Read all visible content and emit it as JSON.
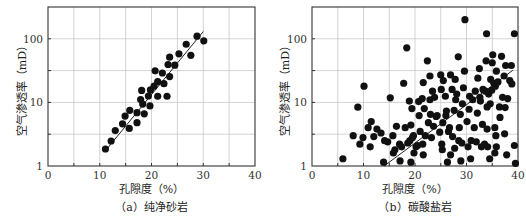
{
  "chart_data": [
    {
      "type": "scatter",
      "panel": "a",
      "title": "",
      "caption": "（a）纯净砂岩",
      "xlabel": "孔隙度（%）",
      "ylabel": "空气渗透率（mD）",
      "xlim": [
        0,
        40
      ],
      "ylim": [
        1,
        316
      ],
      "yscale": "log",
      "xticks": [
        0,
        10,
        20,
        30,
        40
      ],
      "yticks": [
        1,
        10,
        100
      ],
      "grid": true,
      "trendline": {
        "x": [
          11,
          30
        ],
        "y": [
          1.7,
          130
        ]
      },
      "points": [
        [
          11.1,
          1.85
        ],
        [
          12.2,
          2.47
        ],
        [
          13.0,
          3.6
        ],
        [
          14.4,
          4.6
        ],
        [
          14.9,
          6.1
        ],
        [
          15.8,
          7.5
        ],
        [
          15.7,
          3.9
        ],
        [
          17.2,
          4.8
        ],
        [
          17.2,
          6.9
        ],
        [
          17.9,
          11.1
        ],
        [
          18.1,
          15.4
        ],
        [
          18.6,
          6.6
        ],
        [
          18.3,
          9.4
        ],
        [
          19.7,
          8.8
        ],
        [
          19.4,
          12.6
        ],
        [
          19.8,
          15.7
        ],
        [
          20.5,
          18
        ],
        [
          20.7,
          31.3
        ],
        [
          21.2,
          12.5
        ],
        [
          21.2,
          21.2
        ],
        [
          22.1,
          29
        ],
        [
          22.4,
          19.7
        ],
        [
          23.0,
          12.5
        ],
        [
          23.2,
          39.4
        ],
        [
          23.5,
          51.4
        ],
        [
          23.5,
          25.5
        ],
        [
          24.5,
          38.5
        ],
        [
          25.3,
          58
        ],
        [
          26.7,
          82
        ],
        [
          27.6,
          55
        ],
        [
          28.8,
          110
        ],
        [
          30.1,
          93
        ]
      ]
    },
    {
      "type": "scatter",
      "panel": "b",
      "title": "",
      "caption": "（b）碳酸盐岩",
      "xlabel": "孔隙度（%）",
      "ylabel": "空气渗透率（mD）",
      "xlim": [
        0,
        40
      ],
      "ylim": [
        1,
        316
      ],
      "yscale": "log",
      "xticks": [
        0,
        10,
        20,
        30,
        40
      ],
      "yticks": [
        1,
        10,
        100
      ],
      "grid": true,
      "trendline": {
        "x": [
          14,
          39
        ],
        "y": [
          1.0,
          32
        ]
      },
      "points": [
        [
          6.0,
          1.3
        ],
        [
          8.0,
          3.0
        ],
        [
          8.9,
          8.4
        ],
        [
          9.3,
          2.2
        ],
        [
          10.1,
          18
        ],
        [
          9.9,
          2.8
        ],
        [
          10.9,
          4.0
        ],
        [
          11.5,
          5.0
        ],
        [
          11.3,
          2.0
        ],
        [
          12.0,
          2.9
        ],
        [
          12.6,
          3.8
        ],
        [
          13.4,
          3.3
        ],
        [
          13.9,
          1.15
        ],
        [
          14.1,
          2.5
        ],
        [
          14.7,
          2.4
        ],
        [
          15.2,
          11.8
        ],
        [
          15.7,
          3.0
        ],
        [
          15.8,
          1.6
        ],
        [
          16.1,
          1.8
        ],
        [
          16.4,
          4.2
        ],
        [
          17.0,
          2.2
        ],
        [
          17.1,
          1.2
        ],
        [
          17.4,
          2.0
        ],
        [
          17.8,
          20
        ],
        [
          18.1,
          4.0
        ],
        [
          18.4,
          72
        ],
        [
          18.6,
          2.3
        ],
        [
          18.9,
          10.5
        ],
        [
          19.0,
          2.5
        ],
        [
          19.2,
          4.4
        ],
        [
          19.2,
          1.15
        ],
        [
          19.4,
          8.0
        ],
        [
          19.5,
          2.8
        ],
        [
          19.7,
          3.0
        ],
        [
          19.8,
          1.6
        ],
        [
          20.2,
          2.0
        ],
        [
          20.5,
          2.1
        ],
        [
          20.7,
          10.3
        ],
        [
          20.8,
          6.2
        ],
        [
          21.0,
          3.5
        ],
        [
          21.4,
          11.5
        ],
        [
          21.5,
          2.2
        ],
        [
          21.6,
          1.5
        ],
        [
          21.6,
          20.5
        ],
        [
          21.8,
          8.0
        ],
        [
          22.0,
          3.0
        ],
        [
          22.4,
          45
        ],
        [
          22.6,
          4.8
        ],
        [
          22.9,
          11.0
        ],
        [
          22.9,
          26
        ],
        [
          23.0,
          6.5
        ],
        [
          23.2,
          2.8
        ],
        [
          23.4,
          15
        ],
        [
          23.6,
          4.2
        ],
        [
          23.8,
          12.0
        ],
        [
          24.1,
          6.0
        ],
        [
          24.3,
          6.2
        ],
        [
          24.8,
          3.4
        ],
        [
          25.0,
          27
        ],
        [
          25.1,
          16
        ],
        [
          25.2,
          2.2
        ],
        [
          25.3,
          1.8
        ],
        [
          25.4,
          4.8
        ],
        [
          25.5,
          22
        ],
        [
          25.9,
          12.5
        ],
        [
          26.0,
          6.2
        ],
        [
          26.1,
          7.3
        ],
        [
          26.3,
          1.15
        ],
        [
          26.5,
          3.5
        ],
        [
          26.7,
          4.0
        ],
        [
          26.9,
          27
        ],
        [
          26.9,
          1.5
        ],
        [
          27.2,
          16
        ],
        [
          27.3,
          2.9
        ],
        [
          27.6,
          7.5
        ],
        [
          27.7,
          1.9
        ],
        [
          27.8,
          23
        ],
        [
          27.9,
          11
        ],
        [
          28.1,
          13.5
        ],
        [
          28.4,
          52
        ],
        [
          28.5,
          2.5
        ],
        [
          28.6,
          4.0
        ],
        [
          28.8,
          6.5
        ],
        [
          28.9,
          1.2
        ],
        [
          29.1,
          2.3
        ],
        [
          29.2,
          9.5
        ],
        [
          29.4,
          17
        ],
        [
          29.6,
          31
        ],
        [
          29.7,
          200
        ],
        [
          30.1,
          5.0
        ],
        [
          30.3,
          2.0
        ],
        [
          30.5,
          7.8
        ],
        [
          30.6,
          12.5
        ],
        [
          30.8,
          1.3
        ],
        [
          30.9,
          2.5
        ],
        [
          31.2,
          11
        ],
        [
          31.5,
          4.0
        ],
        [
          31.7,
          15
        ],
        [
          31.9,
          2.4
        ],
        [
          32.1,
          6.8
        ],
        [
          32.2,
          24
        ],
        [
          32.5,
          34
        ],
        [
          32.6,
          12
        ],
        [
          32.7,
          10.5
        ],
        [
          32.9,
          2.0
        ],
        [
          33.1,
          4.5
        ],
        [
          33.2,
          16
        ],
        [
          33.5,
          2.2
        ],
        [
          33.7,
          15
        ],
        [
          33.8,
          45
        ],
        [
          33.9,
          120
        ],
        [
          34.0,
          3.8
        ],
        [
          34.0,
          8.5
        ],
        [
          34.1,
          2.0
        ],
        [
          34.3,
          13.5
        ],
        [
          34.5,
          1.3
        ],
        [
          34.6,
          9.5
        ],
        [
          34.7,
          23
        ],
        [
          34.9,
          15.5
        ],
        [
          35.0,
          42
        ],
        [
          35.1,
          56
        ],
        [
          35.3,
          20
        ],
        [
          35.5,
          4.0
        ],
        [
          35.5,
          1.6
        ],
        [
          35.6,
          18
        ],
        [
          35.7,
          3.0
        ],
        [
          35.8,
          2.0
        ],
        [
          35.8,
          31
        ],
        [
          36.1,
          21
        ],
        [
          36.4,
          8.5
        ],
        [
          36.5,
          5.8
        ],
        [
          36.8,
          53
        ],
        [
          37.0,
          12
        ],
        [
          37.3,
          26
        ],
        [
          37.5,
          8.3
        ],
        [
          37.4,
          3.2
        ],
        [
          37.6,
          38
        ],
        [
          37.8,
          1.5
        ],
        [
          38.0,
          11.5
        ],
        [
          38.4,
          22
        ],
        [
          38.7,
          38
        ],
        [
          38.8,
          19.5
        ],
        [
          39.3,
          2.1
        ],
        [
          39.3,
          120
        ],
        [
          39.5,
          1.1
        ]
      ]
    }
  ],
  "panels": {
    "a": {
      "caption": "（a）纯净砂岩",
      "xlabel": "孔隙度（%）",
      "ylabel": "空气渗透率（mD）",
      "xtick_labels": [
        "0",
        "10",
        "20",
        "30",
        "40"
      ],
      "ytick_labels": [
        "1",
        "10",
        "100"
      ]
    },
    "b": {
      "caption": "（b）碳酸盐岩",
      "xlabel": "孔隙度（%）",
      "ylabel": "空气渗透率（mD）",
      "xtick_labels": [
        "0",
        "10",
        "20",
        "30",
        "40"
      ],
      "ytick_labels": [
        "1",
        "10",
        "100"
      ]
    }
  },
  "colors": {
    "marker": "#111111",
    "grid": "#c8c8c8",
    "axis": "#333333",
    "trendline": "#222222"
  }
}
